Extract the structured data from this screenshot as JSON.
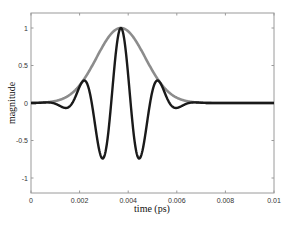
{
  "chart_data": {
    "type": "line",
    "title": "",
    "xlabel": "time (ps)",
    "ylabel": "magnitude",
    "xlim": [
      0,
      0.01
    ],
    "ylim": [
      -1.2,
      1.2
    ],
    "xticks": [
      0,
      0.002,
      0.004,
      0.006,
      0.008,
      0.01
    ],
    "xtick_labels": [
      "0",
      "0.002",
      "0.004",
      "0.006",
      "0.008",
      "0.01"
    ],
    "yticks": [
      1,
      0.5,
      0,
      -0.5,
      -1
    ],
    "ytick_labels": [
      "1",
      "0.5",
      "0",
      "-0.5",
      "-1"
    ],
    "grid": false,
    "legend": null,
    "series": [
      {
        "name": "envelope",
        "color": "#8c8c8c",
        "description": "Gaussian envelope",
        "model": {
          "center": 0.0037,
          "sigma": 0.001,
          "amplitude": 1
        },
        "x": [
          0,
          0.001,
          0.0015,
          0.002,
          0.0025,
          0.003,
          0.0035,
          0.0037,
          0.004,
          0.0045,
          0.005,
          0.0055,
          0.006,
          0.007,
          0.008,
          0.01
        ],
        "values": [
          0.0,
          0.02,
          0.09,
          0.24,
          0.49,
          0.78,
          0.98,
          1.0,
          0.96,
          0.73,
          0.43,
          0.2,
          0.07,
          0.0,
          0.0,
          0.0
        ]
      },
      {
        "name": "pulse",
        "color": "#1a1a1a",
        "description": "Gaussian-modulated cosine pulse",
        "model": {
          "center": 0.0037,
          "sigma": 0.001,
          "period": 0.0016,
          "amplitude": 1
        },
        "x": [
          0,
          0.001,
          0.0013,
          0.0021,
          0.0029,
          0.0037,
          0.0045,
          0.0053,
          0.0061,
          0.007,
          0.01
        ],
        "values": [
          0.0,
          -0.01,
          -0.05,
          0.24,
          -0.67,
          1.0,
          -0.79,
          0.2,
          -0.06,
          0.0,
          0.0
        ]
      }
    ]
  }
}
